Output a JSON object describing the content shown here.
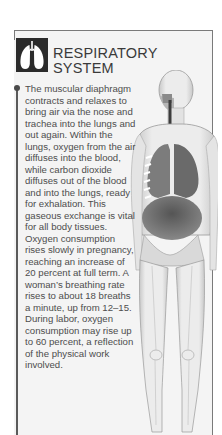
{
  "section": {
    "icon": "lungs-icon",
    "title_line1": "RESPIRATORY",
    "title_line2": "SYSTEM",
    "body": "The muscular diaphragm contracts and relaxes to bring air via the nose and trachea into the lungs and out again. Within the lungs, oxygen from the air diffuses into the blood, while carbon dioxide diffuses out of the blood and into the lungs, ready for exhalation. This gaseous exchange is vital for all body tissues. Oxygen consumption rises slowly in pregnancy, reaching an increase of 20 percent at full term. A woman’s breathing rate rises to about 18 breaths a minute, up from 12–15. During labor, oxygen consumption may rise up to 60 percent, a reflection of the physical work involved."
  },
  "illustration": {
    "subject": "anatomical-female-body-respiratory-system",
    "colors": {
      "panel_bg": "#f4f4f4",
      "icon_bg": "#2b2b2b",
      "text": "#4d4d4d",
      "border": "#7a7a7a"
    }
  }
}
